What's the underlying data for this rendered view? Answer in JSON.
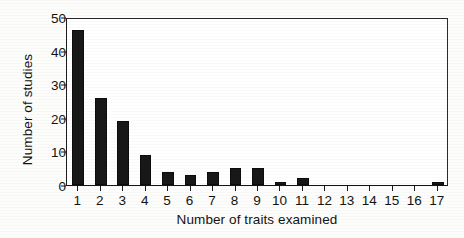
{
  "chart_data": {
    "type": "bar",
    "title": "",
    "xlabel": "Number of traits examined",
    "ylabel": "Number of studies",
    "categories": [
      "1",
      "2",
      "3",
      "4",
      "5",
      "6",
      "7",
      "8",
      "9",
      "10",
      "11",
      "12",
      "13",
      "14",
      "15",
      "16",
      "17"
    ],
    "values": [
      46,
      26,
      19,
      9,
      4,
      3,
      4,
      5,
      5,
      1,
      2,
      0,
      0,
      0,
      0,
      0,
      1
    ],
    "ylim": [
      0,
      50
    ],
    "yticks": [
      0,
      10,
      20,
      30,
      40,
      50
    ],
    "ytick_labels": [
      "0",
      "10",
      "20",
      "30",
      "40",
      "50"
    ],
    "grid": false,
    "legend": false,
    "bar_color": "#181818",
    "background_color": "#ffffff",
    "axis_color": "#1a1a1a"
  }
}
